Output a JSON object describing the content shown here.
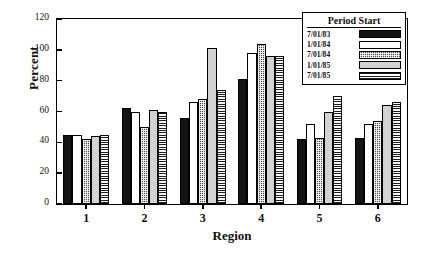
{
  "chart_data": {
    "type": "bar",
    "title": "",
    "xlabel": "Region",
    "ylabel": "Percent",
    "categories": [
      "1",
      "2",
      "3",
      "4",
      "5",
      "6"
    ],
    "ylim": [
      0,
      120
    ],
    "yticks": [
      0,
      20,
      40,
      60,
      80,
      100,
      120
    ],
    "grid": false,
    "legend_position": "top-right",
    "legend_title": "Period Start",
    "series": [
      {
        "name": "7/01/83",
        "pattern": "solid-black",
        "color": "#141414",
        "values": [
          45,
          62,
          56,
          81,
          42,
          43
        ]
      },
      {
        "name": "1/01/84",
        "pattern": "white-open",
        "color": "#ffffff",
        "values": [
          45,
          60,
          66,
          98,
          52,
          52
        ]
      },
      {
        "name": "7/01/84",
        "pattern": "dark-checkered",
        "color": "#4a4a4a",
        "values": [
          42,
          50,
          68,
          104,
          43,
          54
        ]
      },
      {
        "name": "1/01/85",
        "pattern": "light-gray",
        "color": "#d2d2d2",
        "values": [
          44,
          61,
          101,
          96,
          60,
          64
        ]
      },
      {
        "name": "7/01/85",
        "pattern": "horizontal-stripe",
        "color": "#ffffff",
        "values": [
          45,
          60,
          74,
          96,
          70,
          66
        ]
      }
    ]
  }
}
